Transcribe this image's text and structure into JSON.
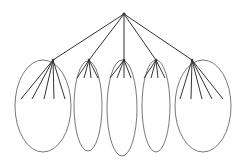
{
  "diagram": {
    "type": "tree",
    "stroke_color": "#333333",
    "ellipse_color": "#555555",
    "root": {
      "x": 124,
      "y": 14
    },
    "groups": [
      {
        "node": {
          "x": 53,
          "y": 60
        },
        "ellipse": {
          "cx": 43,
          "cy": 106,
          "rx": 28,
          "ry": 46
        },
        "leaves": [
          [
            21,
            99
          ],
          [
            32,
            99
          ],
          [
            44,
            99
          ],
          [
            54,
            99
          ],
          [
            65,
            99
          ]
        ]
      },
      {
        "node": {
          "x": 89,
          "y": 60
        },
        "ellipse": {
          "cx": 88,
          "cy": 106,
          "rx": 14,
          "ry": 45
        },
        "leaves": [
          [
            77,
            78
          ],
          [
            84,
            78
          ],
          [
            91,
            78
          ],
          [
            98,
            78
          ]
        ]
      },
      {
        "node": {
          "x": 124,
          "y": 60
        },
        "ellipse": {
          "cx": 122,
          "cy": 108,
          "rx": 15,
          "ry": 48
        },
        "leaves": [
          [
            110,
            78
          ],
          [
            117,
            78
          ],
          [
            124,
            78
          ],
          [
            131,
            78
          ]
        ]
      },
      {
        "node": {
          "x": 156,
          "y": 60
        },
        "ellipse": {
          "cx": 156,
          "cy": 106,
          "rx": 14,
          "ry": 46
        },
        "leaves": [
          [
            144,
            78
          ],
          [
            151,
            78
          ],
          [
            158,
            78
          ],
          [
            165,
            78
          ]
        ]
      },
      {
        "node": {
          "x": 192,
          "y": 60
        },
        "ellipse": {
          "cx": 203,
          "cy": 106,
          "rx": 28,
          "ry": 46
        },
        "leaves": [
          [
            180,
            99
          ],
          [
            191,
            99
          ],
          [
            202,
            99
          ],
          [
            212,
            99
          ],
          [
            223,
            99
          ]
        ]
      }
    ]
  }
}
